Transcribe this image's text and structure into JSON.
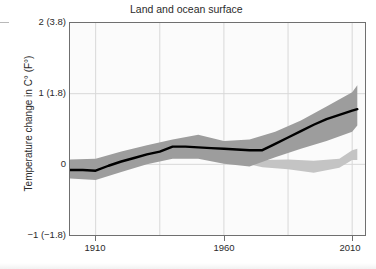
{
  "figure": {
    "title": "Land and ocean surface",
    "y_axis_title": "Temperature change in C° (F°)"
  },
  "colors": {
    "line": "#000000",
    "band_primary": "#9d9d9d",
    "band_secondary": "#c4c4c4",
    "frame": "#6f6f6f",
    "grid": "#d8d8d8",
    "plot_background": "#fbfbfb",
    "text": "#2b2b2b"
  },
  "chart_data": {
    "type": "line",
    "title": "Land and ocean surface",
    "xlabel": "",
    "ylabel": "Temperature change in C° (F°)",
    "xlim": [
      1900,
      2015
    ],
    "ylim": [
      -1,
      2
    ],
    "grid": true,
    "legend": "none",
    "xtick_labels": [
      "1910",
      "1960",
      "2010"
    ],
    "xtick_values": [
      1910,
      1960,
      2010
    ],
    "xgrid_values": [
      1910,
      1935,
      1960,
      1985,
      2010
    ],
    "ytick_labels": [
      "2 (3.8)",
      "1 (1.8)",
      "0",
      "−1 (−1.8)"
    ],
    "ytick_values": [
      2,
      1,
      0,
      -1
    ],
    "series": [
      {
        "name": "Observed temperature change",
        "kind": "line",
        "x": [
          1900,
          1905,
          1910,
          1915,
          1920,
          1925,
          1930,
          1935,
          1940,
          1945,
          1950,
          1955,
          1960,
          1965,
          1970,
          1975,
          1980,
          1985,
          1990,
          1995,
          2000,
          2005,
          2010,
          2012
        ],
        "values": [
          -0.08,
          -0.08,
          -0.09,
          -0.02,
          0.04,
          0.09,
          0.14,
          0.18,
          0.25,
          0.25,
          0.24,
          0.23,
          0.22,
          0.21,
          0.2,
          0.2,
          0.29,
          0.38,
          0.47,
          0.56,
          0.64,
          0.7,
          0.76,
          0.78
        ]
      },
      {
        "name": "Uncertainty range (primary band)",
        "kind": "band",
        "x": [
          1900,
          1910,
          1920,
          1930,
          1940,
          1950,
          1960,
          1970,
          1980,
          1990,
          2000,
          2010,
          2012
        ],
        "upper": [
          0.07,
          0.08,
          0.18,
          0.27,
          0.35,
          0.42,
          0.33,
          0.35,
          0.46,
          0.62,
          0.82,
          1.02,
          1.12
        ],
        "lower": [
          -0.2,
          -0.22,
          -0.11,
          0.0,
          0.08,
          0.08,
          0.01,
          -0.03,
          0.1,
          0.22,
          0.33,
          0.46,
          0.55
        ]
      },
      {
        "name": "Uncertainty range (secondary band)",
        "kind": "band",
        "x": [
          1965,
          1975,
          1985,
          1995,
          2005,
          2010,
          2012
        ],
        "upper": [
          0.1,
          0.06,
          0.07,
          0.05,
          0.08,
          0.2,
          0.22
        ],
        "lower": [
          0.04,
          -0.04,
          -0.07,
          -0.12,
          -0.05,
          0.06,
          0.06
        ]
      }
    ]
  }
}
